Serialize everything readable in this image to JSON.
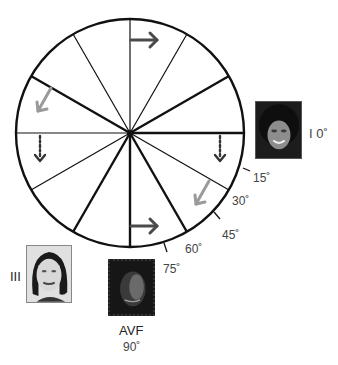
{
  "diagram": {
    "type": "hexaxial-lead-wheel",
    "center": {
      "x": 130,
      "y": 133
    },
    "radius": 114,
    "spoke_count": 12,
    "spoke_step_deg": 30,
    "colors": {
      "line": "#111111",
      "arrow_dark": "#4a4a4a",
      "arrow_gray": "#9a9a9a",
      "label": "#444444"
    }
  },
  "leads": [
    {
      "id": "lead-I",
      "name": "I",
      "angle_label": "0˚",
      "combined_label": "I 0˚"
    },
    {
      "id": "lead-III",
      "name": "III"
    },
    {
      "id": "lead-aVF",
      "name": "AVF",
      "angle_label": "90˚"
    }
  ],
  "degree_ticks": [
    {
      "label": "15˚"
    },
    {
      "label": "30˚"
    },
    {
      "label": "45˚"
    },
    {
      "label": "60˚"
    },
    {
      "label": "75˚"
    }
  ],
  "arrows": [
    {
      "name": "top-right-arrow",
      "style": "solid-dark"
    },
    {
      "name": "bottom-right-arrow",
      "style": "solid-dark"
    },
    {
      "name": "upper-left-arrow",
      "style": "solid-gray"
    },
    {
      "name": "lower-right-arrow",
      "style": "solid-gray"
    },
    {
      "name": "left-dotted-down-arrow",
      "style": "dotted-dark"
    },
    {
      "name": "right-dotted-down-arrow",
      "style": "dotted-dark"
    }
  ]
}
